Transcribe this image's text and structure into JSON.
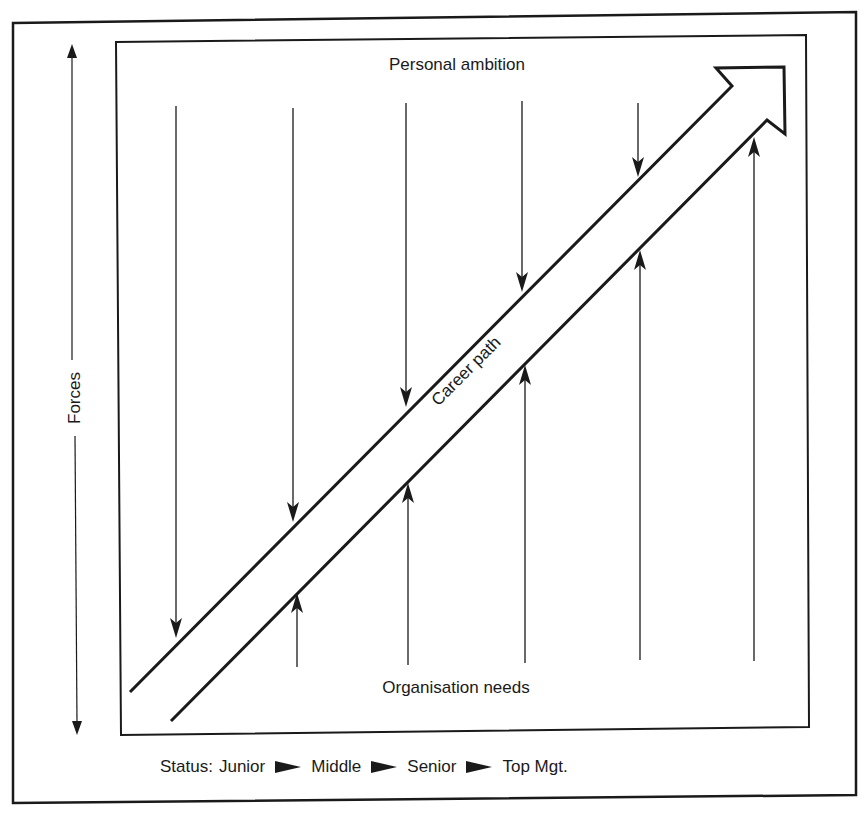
{
  "diagram": {
    "title_top": "Personal ambition",
    "title_bottom": "Organisation needs",
    "axis_label": "Forces",
    "career_label": "Career path",
    "status": {
      "label": "Status:",
      "stages": [
        "Junior",
        "Middle",
        "Senior",
        "Top Mgt."
      ]
    },
    "down_forces": [
      {
        "x": 176,
        "y_start": 106,
        "y_tip": 638
      },
      {
        "x": 293,
        "y_start": 108,
        "y_tip": 522
      },
      {
        "x": 406,
        "y_start": 103,
        "y_tip": 407
      },
      {
        "x": 522,
        "y_start": 101,
        "y_tip": 292
      },
      {
        "x": 638,
        "y_start": 103,
        "y_tip": 177
      }
    ],
    "up_forces": [
      {
        "x": 297,
        "y_start": 667,
        "y_tip": 593
      },
      {
        "x": 408,
        "y_start": 665,
        "y_tip": 483
      },
      {
        "x": 525,
        "y_start": 663,
        "y_tip": 365
      },
      {
        "x": 640,
        "y_start": 660,
        "y_tip": 250
      },
      {
        "x": 754,
        "y_start": 661,
        "y_tip": 137
      }
    ],
    "colors": {
      "ink": "#1a1a1a",
      "background": "#ffffff"
    }
  }
}
